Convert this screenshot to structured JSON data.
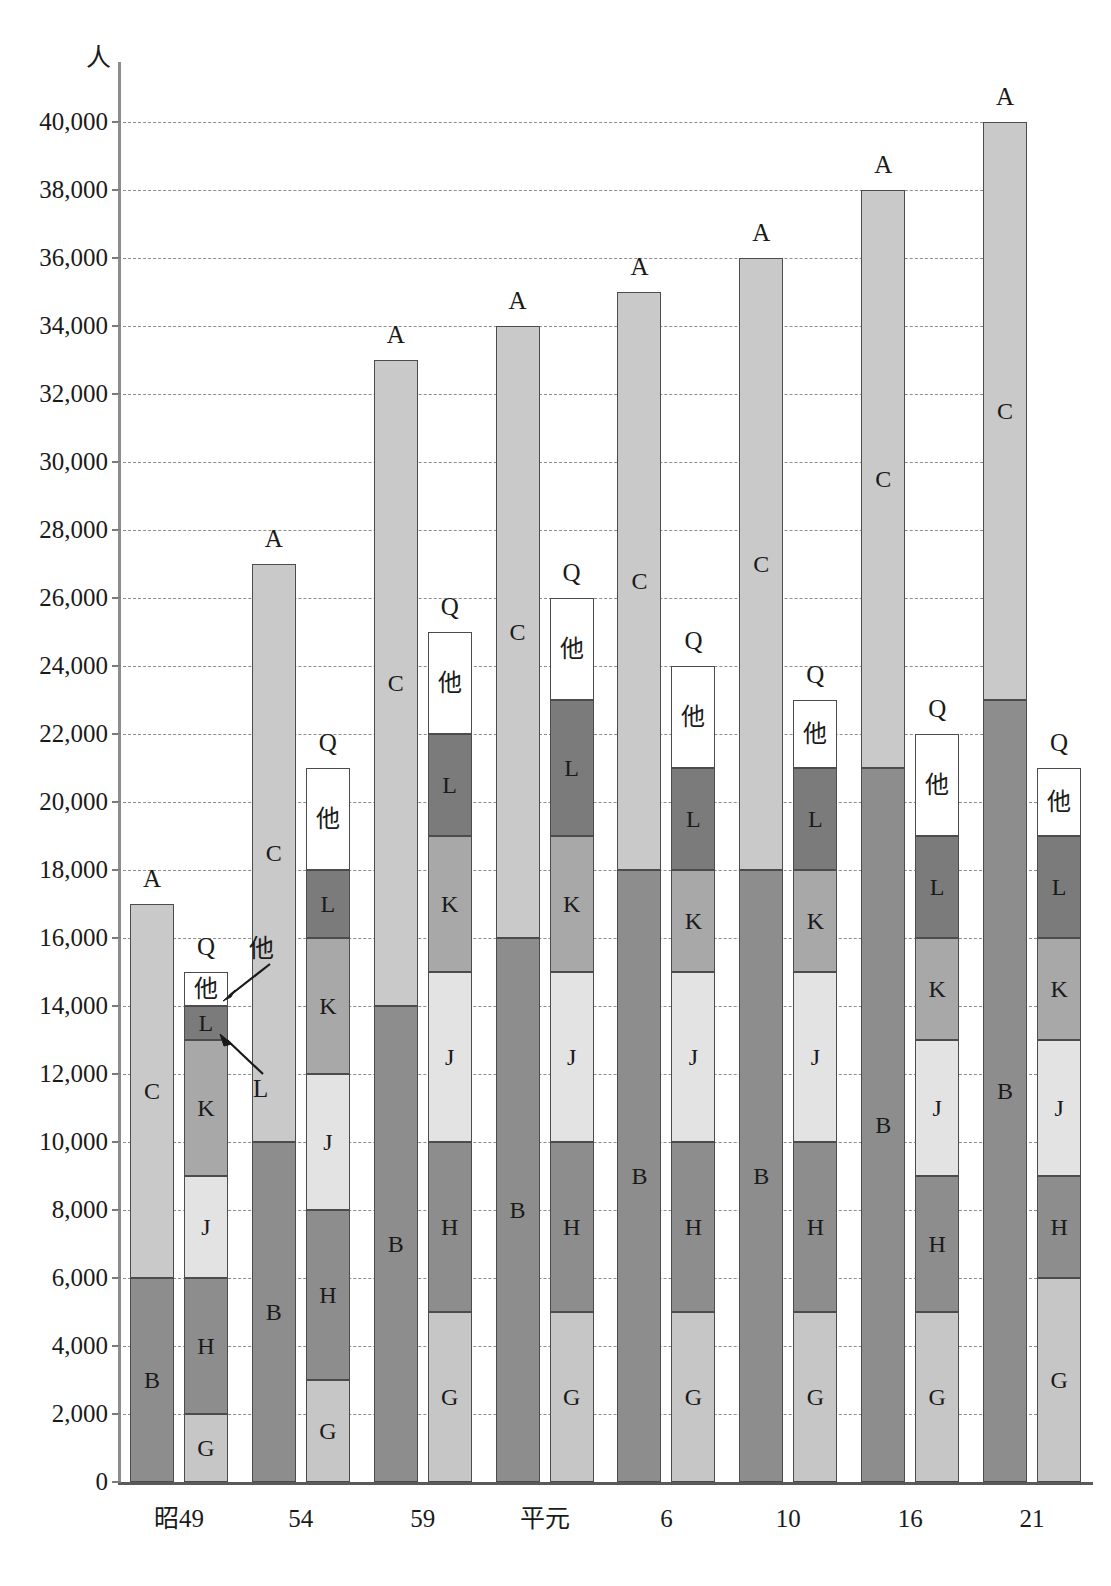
{
  "axis": {
    "unit": "人",
    "y_ticks": [
      "0",
      "2,000",
      "4,000",
      "6,000",
      "8,000",
      "10,000",
      "12,000",
      "14,000",
      "16,000",
      "18,000",
      "20,000",
      "22,000",
      "24,000",
      "26,000",
      "28,000",
      "30,000",
      "32,000",
      "34,000",
      "36,000",
      "38,000",
      "40,000"
    ],
    "x_labels": [
      "昭49",
      "54",
      "59",
      "平元",
      "6",
      "10",
      "16",
      "21"
    ]
  },
  "series_labels": {
    "A": "A",
    "B": "B",
    "C": "C",
    "Q": "Q",
    "G": "G",
    "H": "H",
    "J": "J",
    "K": "K",
    "L": "L",
    "other": "他"
  },
  "annotations": [
    {
      "text": "他",
      "target": "other-segment-1974"
    },
    {
      "text": "L",
      "target": "l-segment-1974"
    }
  ],
  "colors": {
    "B": "#8d8d8d",
    "C": "#c9c9c9",
    "G": "#c6c6c6",
    "H": "#8d8d8d",
    "J": "#e3e3e3",
    "K": "#a8a8a8",
    "L": "#7b7b7b",
    "other": "#ffffff",
    "gridline": "#8e8e8e",
    "axis": "#5a5a5a"
  },
  "chart_data": {
    "type": "bar",
    "title": "",
    "xlabel": "",
    "ylabel": "人",
    "ylim": [
      0,
      40000
    ],
    "ytick_step": 2000,
    "grid": true,
    "legend": "inline segment labels",
    "stacked": true,
    "categories": [
      "昭49",
      "54",
      "59",
      "平元",
      "6",
      "10",
      "16",
      "21"
    ],
    "bar_groups": [
      {
        "category": "昭49",
        "bars": [
          {
            "name": "A",
            "total": 17000,
            "segments": [
              {
                "label": "B",
                "from": 0,
                "to": 6000,
                "value": 6000
              },
              {
                "label": "C",
                "from": 6000,
                "to": 17000,
                "value": 11000
              }
            ]
          },
          {
            "name": "Q",
            "total": 15000,
            "segments": [
              {
                "label": "G",
                "from": 0,
                "to": 2000,
                "value": 2000
              },
              {
                "label": "H",
                "from": 2000,
                "to": 6000,
                "value": 4000
              },
              {
                "label": "J",
                "from": 6000,
                "to": 9000,
                "value": 3000
              },
              {
                "label": "K",
                "from": 9000,
                "to": 13000,
                "value": 4000
              },
              {
                "label": "L",
                "from": 13000,
                "to": 14000,
                "value": 1000
              },
              {
                "label": "他",
                "from": 14000,
                "to": 15000,
                "value": 1000
              }
            ]
          }
        ]
      },
      {
        "category": "54",
        "bars": [
          {
            "name": "A",
            "total": 27000,
            "segments": [
              {
                "label": "B",
                "from": 0,
                "to": 10000,
                "value": 10000
              },
              {
                "label": "C",
                "from": 10000,
                "to": 27000,
                "value": 17000
              }
            ]
          },
          {
            "name": "Q",
            "total": 21000,
            "segments": [
              {
                "label": "G",
                "from": 0,
                "to": 3000,
                "value": 3000
              },
              {
                "label": "H",
                "from": 3000,
                "to": 8000,
                "value": 5000
              },
              {
                "label": "J",
                "from": 8000,
                "to": 12000,
                "value": 4000
              },
              {
                "label": "K",
                "from": 12000,
                "to": 16000,
                "value": 4000
              },
              {
                "label": "L",
                "from": 16000,
                "to": 18000,
                "value": 2000
              },
              {
                "label": "他",
                "from": 18000,
                "to": 21000,
                "value": 3000
              }
            ]
          }
        ]
      },
      {
        "category": "59",
        "bars": [
          {
            "name": "A",
            "total": 33000,
            "segments": [
              {
                "label": "B",
                "from": 0,
                "to": 14000,
                "value": 14000
              },
              {
                "label": "C",
                "from": 14000,
                "to": 33000,
                "value": 19000
              }
            ]
          },
          {
            "name": "Q",
            "total": 25000,
            "segments": [
              {
                "label": "G",
                "from": 0,
                "to": 5000,
                "value": 5000
              },
              {
                "label": "H",
                "from": 5000,
                "to": 10000,
                "value": 5000
              },
              {
                "label": "J",
                "from": 10000,
                "to": 15000,
                "value": 5000
              },
              {
                "label": "K",
                "from": 15000,
                "to": 19000,
                "value": 4000
              },
              {
                "label": "L",
                "from": 19000,
                "to": 22000,
                "value": 3000
              },
              {
                "label": "他",
                "from": 22000,
                "to": 25000,
                "value": 3000
              }
            ]
          }
        ]
      },
      {
        "category": "平元",
        "bars": [
          {
            "name": "A",
            "total": 34000,
            "segments": [
              {
                "label": "B",
                "from": 0,
                "to": 16000,
                "value": 16000
              },
              {
                "label": "C",
                "from": 16000,
                "to": 34000,
                "value": 18000
              }
            ]
          },
          {
            "name": "Q",
            "total": 26000,
            "segments": [
              {
                "label": "G",
                "from": 0,
                "to": 5000,
                "value": 5000
              },
              {
                "label": "H",
                "from": 5000,
                "to": 10000,
                "value": 5000
              },
              {
                "label": "J",
                "from": 10000,
                "to": 15000,
                "value": 5000
              },
              {
                "label": "K",
                "from": 15000,
                "to": 19000,
                "value": 4000
              },
              {
                "label": "L",
                "from": 19000,
                "to": 23000,
                "value": 4000
              },
              {
                "label": "他",
                "from": 23000,
                "to": 26000,
                "value": 3000
              }
            ]
          }
        ]
      },
      {
        "category": "6",
        "bars": [
          {
            "name": "A",
            "total": 35000,
            "segments": [
              {
                "label": "B",
                "from": 0,
                "to": 18000,
                "value": 18000
              },
              {
                "label": "C",
                "from": 18000,
                "to": 35000,
                "value": 17000
              }
            ]
          },
          {
            "name": "Q",
            "total": 24000,
            "segments": [
              {
                "label": "G",
                "from": 0,
                "to": 5000,
                "value": 5000
              },
              {
                "label": "H",
                "from": 5000,
                "to": 10000,
                "value": 5000
              },
              {
                "label": "J",
                "from": 10000,
                "to": 15000,
                "value": 5000
              },
              {
                "label": "K",
                "from": 15000,
                "to": 18000,
                "value": 3000
              },
              {
                "label": "L",
                "from": 18000,
                "to": 21000,
                "value": 3000
              },
              {
                "label": "他",
                "from": 21000,
                "to": 24000,
                "value": 3000
              }
            ]
          }
        ]
      },
      {
        "category": "10",
        "bars": [
          {
            "name": "A",
            "total": 36000,
            "segments": [
              {
                "label": "B",
                "from": 0,
                "to": 18000,
                "value": 18000
              },
              {
                "label": "C",
                "from": 18000,
                "to": 36000,
                "value": 18000
              }
            ]
          },
          {
            "name": "Q",
            "total": 23000,
            "segments": [
              {
                "label": "G",
                "from": 0,
                "to": 5000,
                "value": 5000
              },
              {
                "label": "H",
                "from": 5000,
                "to": 10000,
                "value": 5000
              },
              {
                "label": "J",
                "from": 10000,
                "to": 15000,
                "value": 5000
              },
              {
                "label": "K",
                "from": 15000,
                "to": 18000,
                "value": 3000
              },
              {
                "label": "L",
                "from": 18000,
                "to": 21000,
                "value": 3000
              },
              {
                "label": "他",
                "from": 21000,
                "to": 23000,
                "value": 2000
              }
            ]
          }
        ]
      },
      {
        "category": "16",
        "bars": [
          {
            "name": "A",
            "total": 38000,
            "segments": [
              {
                "label": "B",
                "from": 0,
                "to": 21000,
                "value": 21000
              },
              {
                "label": "C",
                "from": 21000,
                "to": 38000,
                "value": 17000
              }
            ]
          },
          {
            "name": "Q",
            "total": 22000,
            "segments": [
              {
                "label": "G",
                "from": 0,
                "to": 5000,
                "value": 5000
              },
              {
                "label": "H",
                "from": 5000,
                "to": 9000,
                "value": 4000
              },
              {
                "label": "J",
                "from": 9000,
                "to": 13000,
                "value": 4000
              },
              {
                "label": "K",
                "from": 13000,
                "to": 16000,
                "value": 3000
              },
              {
                "label": "L",
                "from": 16000,
                "to": 19000,
                "value": 3000
              },
              {
                "label": "他",
                "from": 19000,
                "to": 22000,
                "value": 3000
              }
            ]
          }
        ]
      },
      {
        "category": "21",
        "bars": [
          {
            "name": "A",
            "total": 40000,
            "segments": [
              {
                "label": "B",
                "from": 0,
                "to": 23000,
                "value": 23000
              },
              {
                "label": "C",
                "from": 23000,
                "to": 40000,
                "value": 17000
              }
            ]
          },
          {
            "name": "Q",
            "total": 21000,
            "segments": [
              {
                "label": "G",
                "from": 0,
                "to": 6000,
                "value": 6000
              },
              {
                "label": "H",
                "from": 6000,
                "to": 9000,
                "value": 3000
              },
              {
                "label": "J",
                "from": 9000,
                "to": 13000,
                "value": 4000
              },
              {
                "label": "K",
                "from": 13000,
                "to": 16000,
                "value": 3000
              },
              {
                "label": "L",
                "from": 16000,
                "to": 19000,
                "value": 3000
              },
              {
                "label": "他",
                "from": 19000,
                "to": 21000,
                "value": 2000
              }
            ]
          }
        ]
      }
    ]
  }
}
